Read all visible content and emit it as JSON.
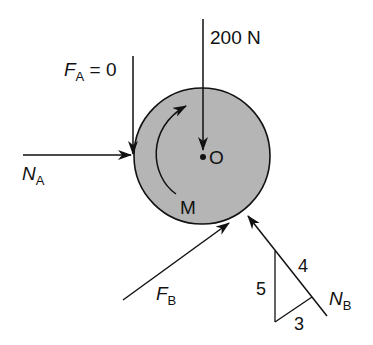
{
  "diagram": {
    "type": "free-body-diagram",
    "body": {
      "shape": "disk",
      "fill": "#b5b5b5",
      "stroke": "#111111",
      "center_label": "O",
      "moment_label": "M"
    },
    "forces": {
      "applied_load": {
        "label": "200 N",
        "direction": "down"
      },
      "friction_A": {
        "symbol": "F",
        "subscript": "A",
        "suffix": " = 0",
        "direction": "down"
      },
      "normal_A": {
        "symbol": "N",
        "subscript": "A",
        "direction": "right"
      },
      "friction_B": {
        "symbol": "F",
        "subscript": "B",
        "direction": "up-right"
      },
      "normal_B": {
        "symbol": "N",
        "subscript": "B",
        "direction": "up-left"
      }
    },
    "slope_triangle": {
      "vertical": "5",
      "hypotenuse": "4",
      "base": "3"
    },
    "colors": {
      "line": "#111111",
      "disk_fill": "#b5b5b5",
      "background": "#ffffff"
    }
  }
}
